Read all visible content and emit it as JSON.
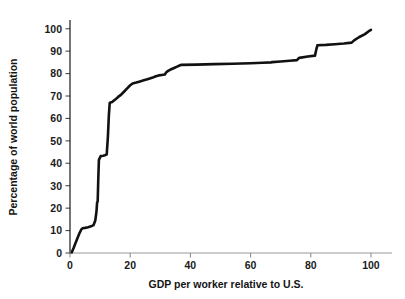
{
  "chart_data": {
    "type": "line",
    "title": "",
    "subtitle": "",
    "xlabel": "GDP per worker relative to U.S.",
    "ylabel": "Percentage of world population",
    "xlim": [
      0,
      104
    ],
    "ylim": [
      0,
      103
    ],
    "xticks": [
      0,
      20,
      40,
      60,
      80,
      100
    ],
    "xtick_labels": [
      "0",
      "20",
      "40",
      "60",
      "80",
      "100"
    ],
    "yticks": [
      0,
      10,
      20,
      30,
      40,
      50,
      60,
      70,
      80,
      90,
      100
    ],
    "ytick_labels": [
      "0",
      "10",
      "20",
      "30",
      "40",
      "50",
      "60",
      "70",
      "80",
      "90",
      "100"
    ],
    "grid": false,
    "legend": null,
    "legend_position": "none",
    "annotations": [],
    "series": [
      {
        "name": "Cumulative share of world population",
        "color": "#111111",
        "x": [
          0.6,
          1.2,
          2.0,
          2.6,
          3.2,
          3.8,
          4.2,
          5.0,
          6.0,
          7.0,
          7.8,
          8.4,
          8.8,
          9.0,
          9.2,
          9.4,
          9.6,
          10.2,
          11.0,
          11.6,
          12.2,
          12.6,
          12.9,
          13.2,
          14.0,
          15.0,
          16.0,
          17.0,
          18.0,
          19.0,
          20.0,
          20.8,
          21.4,
          22.0,
          23.0,
          24.5,
          26.0,
          27.5,
          28.5,
          29.5,
          30.5,
          31.5,
          32.0,
          32.6,
          33.4,
          34.4,
          35.4,
          36.4,
          37.0,
          42.0,
          48.0,
          54.0,
          60.0,
          64.0,
          66.8,
          67.2,
          70.0,
          73.0,
          75.4,
          75.8,
          76.2,
          79.0,
          81.4,
          81.8,
          82.2,
          85.0,
          88.0,
          91.0,
          93.6,
          94.4,
          96.0,
          98.0,
          99.6,
          100.0
        ],
        "y": [
          0.3,
          2.2,
          5.0,
          7.0,
          9.0,
          10.6,
          11.0,
          11.2,
          11.5,
          11.9,
          12.4,
          14.5,
          18.5,
          22.5,
          23.0,
          33.0,
          41.5,
          43.2,
          43.4,
          43.6,
          44.0,
          52.0,
          61.0,
          67.0,
          67.3,
          68.4,
          69.6,
          70.6,
          72.0,
          73.4,
          74.8,
          75.6,
          75.8,
          76.0,
          76.4,
          77.0,
          77.6,
          78.2,
          78.8,
          79.2,
          79.4,
          79.6,
          80.6,
          81.2,
          81.8,
          82.4,
          83.0,
          83.6,
          83.9,
          84.0,
          84.2,
          84.4,
          84.6,
          84.8,
          85.0,
          85.1,
          85.4,
          85.7,
          86.0,
          86.6,
          87.0,
          87.6,
          88.0,
          90.5,
          92.6,
          92.8,
          93.1,
          93.4,
          93.8,
          94.8,
          96.2,
          97.6,
          99.2,
          99.5
        ]
      }
    ]
  },
  "layout": {
    "plot_left_px": 70,
    "plot_right_px": 383,
    "plot_top_px": 22,
    "plot_bottom_px": 253,
    "background_color": "#ffffff",
    "line_color": "#111111",
    "y_axis_color": "#1a1a1a",
    "x_axis_color": "#9a9a9a",
    "text_color": "#141414"
  }
}
